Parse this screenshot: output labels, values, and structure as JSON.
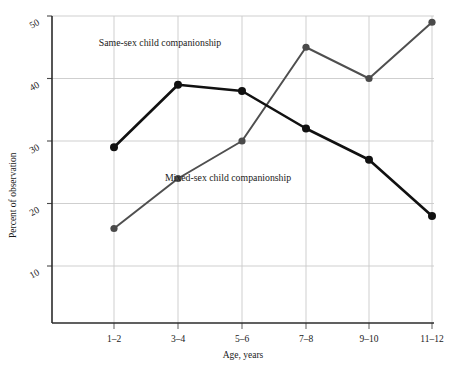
{
  "chart_data": {
    "type": "line",
    "title": "",
    "xlabel": "Age, years",
    "ylabel": "Percent of observation",
    "categories": [
      "1–2",
      "3–4",
      "5–6",
      "7–8",
      "9–10",
      "11–12"
    ],
    "xlim": [
      0,
      7
    ],
    "ylim": [
      0,
      52
    ],
    "yticks": [
      10,
      20,
      30,
      40,
      50
    ],
    "ytick_labels": [
      "10",
      "20",
      "30",
      "40",
      "50"
    ],
    "grid": true,
    "legend_position": "inline-annotations",
    "series": [
      {
        "name": "Same-sex child companionship",
        "values": [
          16,
          24,
          30,
          45,
          40,
          49
        ],
        "color": "#4a4a4a",
        "marker": "circle",
        "label_x_pct": 43,
        "label_y_pct": 11
      },
      {
        "name": "Mixed-sex child companionship",
        "values": [
          29,
          39,
          38,
          32,
          27,
          18
        ],
        "color": "#111111",
        "marker": "circle",
        "label_x_pct": 50,
        "label_y_pct": 47
      }
    ],
    "annotations": [
      {
        "text": "Same-sex child companionship",
        "x": 160,
        "y": 46
      },
      {
        "text": "Mixed-sex child companionship",
        "x": 228,
        "y": 181
      }
    ]
  },
  "axis": {
    "y_title": "Percent of observation",
    "x_title": "Age, years"
  }
}
